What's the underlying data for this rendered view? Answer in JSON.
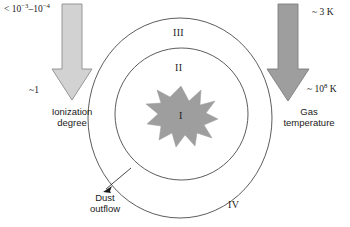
{
  "figure": {
    "colors": {
      "background": "#ffffff",
      "outline": "#4a4a4a",
      "left_arrow_fill": "#d2d2d2",
      "left_arrow_stroke": "#8c8c8c",
      "right_arrow_fill": "#9e9e9e",
      "right_arrow_stroke": "#7d7d7d",
      "starburst_fill": "#9e9e9e",
      "text": "#1a1a1a"
    }
  },
  "left_axis": {
    "name": "ionization-degree",
    "top_value": "< 10",
    "top_exp_1": "−3",
    "top_dash": "–10",
    "top_exp_2": "−4",
    "bottom_value": "~1",
    "caption_line1": "Ionization",
    "caption_line2": "degree",
    "arrow_direction": "down"
  },
  "right_axis": {
    "name": "gas-temperature",
    "top_value": "~ 3 K",
    "bottom_value": "~ 10",
    "bottom_exp": "8",
    "bottom_unit": " K",
    "caption_line1": "Gas",
    "caption_line2": "temperature",
    "arrow_direction": "down"
  },
  "zones": [
    {
      "id": "I",
      "label": "I",
      "region": "central-starburst"
    },
    {
      "id": "II",
      "label": "II",
      "region": "inner-ellipse"
    },
    {
      "id": "III",
      "label": "III",
      "region": "outer-ring"
    },
    {
      "id": "IV",
      "label": "IV",
      "region": "outer-region"
    }
  ],
  "annotation": {
    "name": "dust-outflow",
    "line1": "Dust",
    "line2": "outflow"
  }
}
